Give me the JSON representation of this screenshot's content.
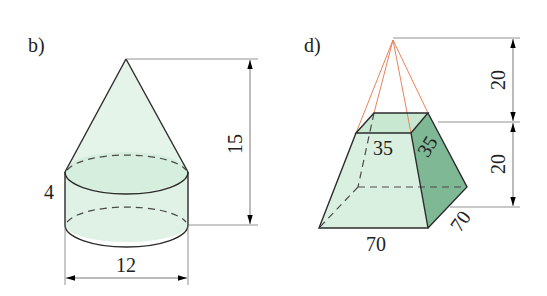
{
  "figure_b": {
    "label": "b)",
    "shape": "cone on cylinder",
    "dimensions": {
      "cylinder_height": "4",
      "diameter": "12",
      "total_height": "15"
    }
  },
  "figure_d": {
    "label": "d)",
    "shape": "frustum of square pyramid with extended apex",
    "dimensions": {
      "upper_height": "20",
      "frustum_height": "20",
      "top_edge_front": "35",
      "top_edge_side": "35",
      "base_edge_front": "70",
      "base_edge_side": "70"
    }
  },
  "colors": {
    "fill_light": "#d9f0e0",
    "fill_side": "#7fb894",
    "fill_top": "#c4e6cf",
    "edge": "#2b2b2b",
    "apex_lines": "#e8835a",
    "dimension_lines": "#777777"
  }
}
